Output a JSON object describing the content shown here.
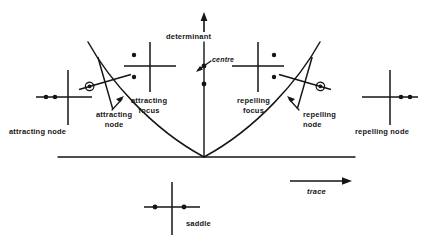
{
  "figure": {
    "axes": {
      "vertical_label": "determinant",
      "horizontal_label": "trace",
      "vertical_arrow": "up-arrow",
      "horizontal_arrow": "right-arrow"
    },
    "curve": {
      "name": "discriminant parabola",
      "equation_implied": "determinant = trace^2 / 4"
    },
    "labels": [
      {
        "id": "determinant",
        "text": "determinant",
        "x": 166,
        "y": 33,
        "size": "md"
      },
      {
        "id": "centre",
        "text": "centre",
        "x": 212,
        "y": 60,
        "size": "sm",
        "italic": true
      },
      {
        "id": "attracting-node-left",
        "text": "attracting node",
        "x": 9,
        "y": 128,
        "size": "md"
      },
      {
        "id": "attracting-degenerate-node",
        "line1": "attracting",
        "line2": "node",
        "x": 96,
        "y": 113,
        "size": "md"
      },
      {
        "id": "attracting-focus",
        "line1": "attracting",
        "line2": "focus",
        "x": 131,
        "y": 96,
        "size": "md"
      },
      {
        "id": "repelling-focus",
        "line1": "repelling",
        "line2": "focus",
        "x": 237,
        "y": 96,
        "size": "md"
      },
      {
        "id": "repelling-degenerate-node",
        "line1": "repelling",
        "line2": "node",
        "x": 300,
        "y": 113,
        "size": "md"
      },
      {
        "id": "repelling-node-right",
        "text": "repelling node",
        "x": 355,
        "y": 128,
        "size": "md"
      },
      {
        "id": "saddle",
        "text": "saddle",
        "x": 186,
        "y": 223,
        "size": "md"
      },
      {
        "id": "trace",
        "text": "trace",
        "x": 307,
        "y": 190,
        "size": "md",
        "italic": true
      }
    ],
    "eigenvalue_diagrams": [
      {
        "id": "attracting-node",
        "name": "attracting node",
        "cx": 68,
        "cy": 97,
        "eigenvalues": [
          {
            "re": -22,
            "im": 0,
            "style": "dot"
          },
          {
            "re": -13,
            "im": 0,
            "style": "dot"
          }
        ],
        "description": "two distinct negative real eigenvalues"
      },
      {
        "id": "attracting-degenerate-node",
        "name": "attracting degenerate node",
        "cx": 105,
        "cy": 82,
        "rotated": true,
        "eigenvalues": [
          {
            "re": -16,
            "im": 0,
            "style": "circled-dot"
          }
        ],
        "description": "repeated negative real eigenvalue"
      },
      {
        "id": "attracting-focus",
        "name": "attracting focus",
        "cx": 150,
        "cy": 66,
        "eigenvalues": [
          {
            "re": -13,
            "im": 10,
            "style": "dot"
          },
          {
            "re": -13,
            "im": -10,
            "style": "dot"
          }
        ],
        "description": "complex pair with negative real part"
      },
      {
        "id": "centre",
        "name": "centre",
        "cx": 205,
        "cy": 73,
        "eigenvalues": [
          {
            "re": 0,
            "im": 10,
            "style": "dot"
          },
          {
            "re": 0,
            "im": -10,
            "style": "dot"
          }
        ],
        "description": "purely imaginary pair"
      },
      {
        "id": "repelling-focus",
        "name": "repelling focus",
        "cx": 258,
        "cy": 66,
        "eigenvalues": [
          {
            "re": 13,
            "im": 10,
            "style": "dot"
          },
          {
            "re": 13,
            "im": -10,
            "style": "dot"
          }
        ],
        "description": "complex pair with positive real part"
      },
      {
        "id": "repelling-degenerate-node",
        "name": "repelling degenerate node",
        "cx": 305,
        "cy": 82,
        "rotated": true,
        "eigenvalues": [
          {
            "re": 16,
            "im": 0,
            "style": "circled-dot"
          }
        ],
        "description": "repeated positive real eigenvalue"
      },
      {
        "id": "repelling-node",
        "name": "repelling node",
        "cx": 390,
        "cy": 97,
        "eigenvalues": [
          {
            "re": 13,
            "im": 0,
            "style": "dot"
          },
          {
            "re": 22,
            "im": 0,
            "style": "dot"
          }
        ],
        "description": "two distinct positive real eigenvalues"
      },
      {
        "id": "saddle",
        "name": "saddle",
        "cx": 172,
        "cy": 207,
        "eigenvalues": [
          {
            "re": -14,
            "im": 0,
            "style": "dot"
          },
          {
            "re": 10,
            "im": 0,
            "style": "dot"
          }
        ],
        "description": "one negative and one positive real eigenvalue"
      }
    ],
    "colors": {
      "ink": "#151515",
      "paper": "#ffffff"
    }
  }
}
